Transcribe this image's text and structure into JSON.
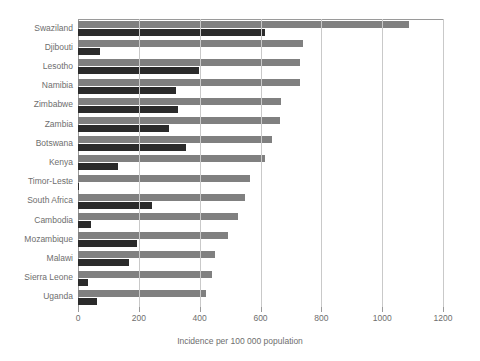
{
  "chart_data": {
    "type": "bar",
    "orientation": "horizontal",
    "title": "",
    "xlabel": "Incidence per 100 000 population",
    "ylabel": "",
    "xlim": [
      0,
      1200
    ],
    "xticks": [
      0,
      200,
      400,
      600,
      800,
      1000,
      1200
    ],
    "grid": true,
    "legend": "none",
    "categories": [
      "Swaziland",
      "Djibouti",
      "Lesotho",
      "Namibia",
      "Zimbabwe",
      "Zambia",
      "Botswana",
      "Kenya",
      "Timor-Leste",
      "South Africa",
      "Cambodia",
      "Mozambique",
      "Malawi",
      "Sierra Leone",
      "Uganda"
    ],
    "series": [
      {
        "name": "Total incidence",
        "color": "#808080",
        "values": [
          1089,
          740,
          730,
          730,
          668,
          664,
          638,
          615,
          566,
          548,
          525,
          494,
          451,
          441,
          421
        ]
      },
      {
        "name": "HIV-positive incidence",
        "color": "#2b2b2b",
        "values": [
          615,
          72,
          398,
          322,
          329,
          299,
          355,
          132,
          4,
          244,
          43,
          194,
          168,
          33,
          63
        ]
      }
    ]
  },
  "colors": {
    "light_bar": "#808080",
    "dark_bar": "#2b2b2b",
    "gridline": "#c9c9c9",
    "axis": "#9a9a9a",
    "text": "#6e6e6e",
    "background": "#ffffff"
  }
}
